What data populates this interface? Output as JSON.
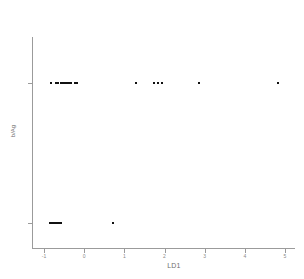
{
  "chart_data": {
    "type": "scatter",
    "title": "",
    "xlabel": "LD1",
    "ylabel": "b/Ag",
    "xlim": [
      -1.3,
      5.25
    ],
    "ylim": [
      0,
      1
    ],
    "grid": false,
    "legend": "none",
    "xticks": [
      -1,
      0,
      1,
      2,
      3,
      4,
      5
    ],
    "xticklabels": [
      "-1",
      "0",
      "1",
      "2",
      "3",
      "4",
      "5"
    ],
    "yticks": [
      0.78,
      0.12
    ],
    "yticklabels": [
      "",
      ""
    ],
    "marker": "square",
    "marker_color": "#111111",
    "marker_size": 2,
    "axis_color": "#9b9b9b",
    "series": [
      {
        "name": "group-upper",
        "y": 0.78,
        "x": [
          -0.83,
          -0.7,
          -0.65,
          -0.58,
          -0.55,
          -0.52,
          -0.49,
          -0.46,
          -0.43,
          -0.4,
          -0.37,
          -0.34,
          -0.24,
          -0.19,
          1.29,
          1.73,
          1.84,
          1.94,
          2.86,
          4.83
        ]
      },
      {
        "name": "group-lower",
        "y": 0.12,
        "x": [
          -0.86,
          -0.83,
          -0.8,
          -0.77,
          -0.74,
          -0.71,
          -0.68,
          -0.65,
          -0.62,
          -0.59,
          0.72
        ]
      }
    ]
  },
  "axis": {
    "x_label": "LD1",
    "y_label": "b/Ag",
    "x_tick_labels": [
      "-1",
      "0",
      "1",
      "2",
      "3",
      "4",
      "5"
    ]
  }
}
